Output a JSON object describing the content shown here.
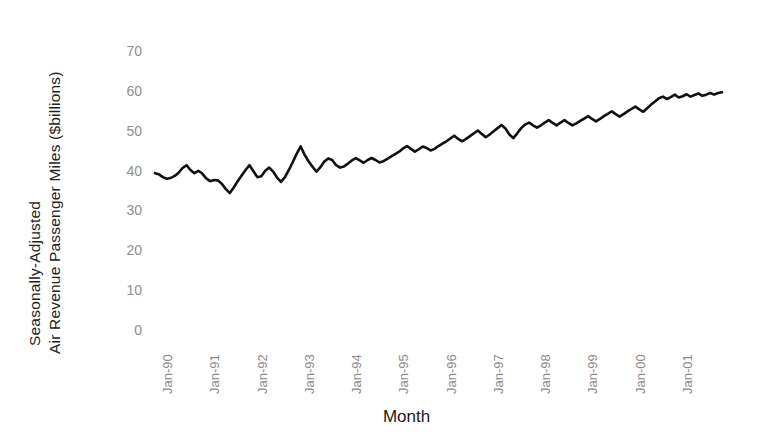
{
  "chart_data": {
    "type": "line",
    "title": "",
    "xlabel": "Month",
    "ylabel_line1": "Seasonally-Adjusted",
    "ylabel_line2": "Air Revenue Passenger Miles ($billions)",
    "ylim": [
      0,
      70
    ],
    "yticks": [
      70,
      60,
      50,
      40,
      30,
      20,
      10,
      0
    ],
    "ytick_labels": [
      "70",
      "60",
      "50",
      "40",
      "30",
      "20",
      "10",
      "0"
    ],
    "grid": false,
    "legend": "none",
    "line_color": "#111111",
    "xtick_labels": [
      "Jan-90",
      "Jan-91",
      "Jan-92",
      "Jan-93",
      "Jan-94",
      "Jan-95",
      "Jan-96",
      "Jan-97",
      "Jan-98",
      "Jan-99",
      "Jan-00",
      "Jan-01"
    ],
    "x_start": "Jan-90",
    "x_end": "Jul-01",
    "x_frequency": "monthly",
    "values": [
      39.6,
      39.3,
      38.6,
      38.2,
      38.4,
      38.9,
      39.7,
      40.9,
      41.6,
      40.4,
      39.6,
      40.2,
      39.5,
      38.3,
      37.6,
      37.9,
      37.8,
      36.9,
      35.6,
      34.6,
      36.0,
      37.6,
      39.0,
      40.4,
      41.6,
      40.1,
      38.6,
      38.8,
      40.2,
      41.0,
      40.0,
      38.5,
      37.4,
      38.6,
      40.4,
      42.4,
      44.5,
      46.3,
      44.2,
      42.6,
      41.2,
      40.0,
      41.1,
      42.5,
      43.3,
      42.9,
      41.6,
      41.0,
      41.3,
      42.0,
      42.8,
      43.4,
      42.8,
      42.2,
      42.9,
      43.4,
      42.9,
      42.3,
      42.6,
      43.2,
      43.8,
      44.4,
      45.0,
      45.8,
      46.4,
      45.7,
      45.0,
      45.6,
      46.3,
      45.9,
      45.3,
      45.7,
      46.4,
      47.0,
      47.6,
      48.3,
      49.0,
      48.2,
      47.6,
      48.2,
      48.9,
      49.6,
      50.3,
      49.4,
      48.6,
      49.3,
      50.1,
      50.9,
      51.7,
      50.8,
      49.3,
      48.4,
      49.6,
      50.9,
      51.8,
      52.3,
      51.6,
      51.0,
      51.6,
      52.3,
      52.9,
      52.2,
      51.6,
      52.3,
      52.9,
      52.2,
      51.6,
      52.1,
      52.7,
      53.3,
      53.9,
      53.2,
      52.6,
      53.2,
      53.9,
      54.5,
      55.1,
      54.4,
      53.8,
      54.4,
      55.1,
      55.7,
      56.3,
      55.6,
      55.0,
      55.9,
      56.8,
      57.6,
      58.4,
      58.8,
      58.2,
      58.7,
      59.3,
      58.6,
      58.9,
      59.4,
      58.8,
      59.2,
      59.6,
      59.0,
      59.3,
      59.7,
      59.3,
      59.7,
      59.9
    ]
  },
  "axes": {
    "x_title": "Month"
  }
}
